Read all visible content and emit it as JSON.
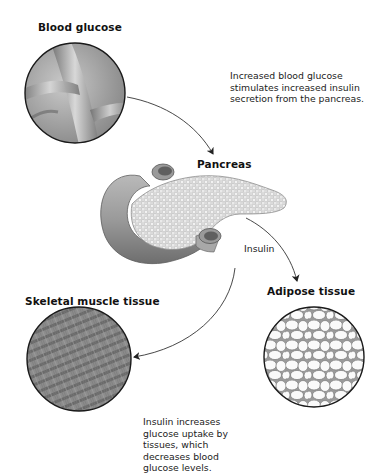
{
  "diagram": {
    "topic": "Insulin regulation of blood glucose",
    "nodes": {
      "blood_glucose": {
        "label": "Blood glucose",
        "image": "blood-vessel-illustration"
      },
      "pancreas": {
        "label": "Pancreas",
        "image": "pancreas-illustration"
      },
      "adipose": {
        "label": "Adipose tissue",
        "image": "adipose-cells-illustration"
      },
      "muscle": {
        "label": "Skeletal muscle tissue",
        "image": "muscle-fibers-illustration"
      }
    },
    "notes": {
      "top": "Increased blood glucose stimulates increased insulin secretion from the pancreas.",
      "bottom": "Insulin increases glucose uptake by tissues, which decreases blood glucose levels."
    },
    "arrows": [
      {
        "from": "blood_glucose",
        "to": "pancreas",
        "label": ""
      },
      {
        "from": "pancreas",
        "to": "adipose",
        "label": "Insulin"
      },
      {
        "from": "pancreas",
        "to": "muscle",
        "label": ""
      }
    ],
    "arrow_labels": {
      "insulin": "Insulin"
    },
    "colors": {
      "outline": "#1a1a1a",
      "tissue_gray": "#8a8a8a",
      "background": "#ffffff"
    }
  }
}
